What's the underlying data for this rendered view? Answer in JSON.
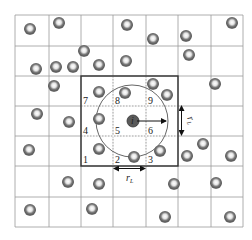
{
  "diagram": {
    "type": "cell-linked-list neighbor search grid",
    "grid": {
      "x_lines": [
        15,
        49,
        81,
        113,
        146,
        178,
        211,
        243
      ],
      "y_lines": [
        15,
        46,
        76,
        106,
        136,
        166,
        197,
        227
      ],
      "line_color": "#9a9a9a"
    },
    "highlight_box": {
      "x": 81,
      "y": 76,
      "w": 97,
      "h": 90,
      "color": "#333333"
    },
    "search_circle": {
      "cx": 132,
      "cy": 121,
      "r": 36,
      "color": "#555555"
    },
    "center_particle": {
      "cx": 133,
      "cy": 121,
      "label": "i"
    },
    "cell_labels": [
      {
        "text": "7",
        "x": 83,
        "y": 104
      },
      {
        "text": "8",
        "x": 115,
        "y": 104
      },
      {
        "text": "9",
        "x": 148,
        "y": 104
      },
      {
        "text": "4",
        "x": 83,
        "y": 134
      },
      {
        "text": "5",
        "x": 115,
        "y": 134
      },
      {
        "text": "6",
        "x": 148,
        "y": 134
      },
      {
        "text": "1",
        "x": 83,
        "y": 163
      },
      {
        "text": "2",
        "x": 115,
        "y": 163
      },
      {
        "text": "3",
        "x": 148,
        "y": 163
      }
    ],
    "dimension_labels": {
      "horizontal": "r",
      "horizontal_sub": "L",
      "vertical": "r",
      "vertical_sub": "L"
    },
    "particles": [
      {
        "cx": 30,
        "cy": 29
      },
      {
        "cx": 59,
        "cy": 23
      },
      {
        "cx": 127,
        "cy": 25
      },
      {
        "cx": 153,
        "cy": 39
      },
      {
        "cx": 186,
        "cy": 36
      },
      {
        "cx": 232,
        "cy": 23
      },
      {
        "cx": 84,
        "cy": 51
      },
      {
        "cx": 126,
        "cy": 61
      },
      {
        "cx": 189,
        "cy": 55
      },
      {
        "cx": 36,
        "cy": 69
      },
      {
        "cx": 56,
        "cy": 67
      },
      {
        "cx": 73,
        "cy": 67
      },
      {
        "cx": 99,
        "cy": 65
      },
      {
        "cx": 54,
        "cy": 86
      },
      {
        "cx": 99,
        "cy": 92
      },
      {
        "cx": 125,
        "cy": 93
      },
      {
        "cx": 153,
        "cy": 84
      },
      {
        "cx": 167,
        "cy": 95
      },
      {
        "cx": 215,
        "cy": 84
      },
      {
        "cx": 37,
        "cy": 114
      },
      {
        "cx": 69,
        "cy": 122
      },
      {
        "cx": 99,
        "cy": 119
      },
      {
        "cx": 29,
        "cy": 150
      },
      {
        "cx": 99,
        "cy": 149
      },
      {
        "cx": 134,
        "cy": 157
      },
      {
        "cx": 160,
        "cy": 151
      },
      {
        "cx": 187,
        "cy": 156
      },
      {
        "cx": 203,
        "cy": 144
      },
      {
        "cx": 231,
        "cy": 156
      },
      {
        "cx": 68,
        "cy": 182
      },
      {
        "cx": 99,
        "cy": 184
      },
      {
        "cx": 174,
        "cy": 184
      },
      {
        "cx": 216,
        "cy": 183
      },
      {
        "cx": 30,
        "cy": 210
      },
      {
        "cx": 92,
        "cy": 209
      },
      {
        "cx": 165,
        "cy": 217
      },
      {
        "cx": 230,
        "cy": 217
      }
    ]
  }
}
